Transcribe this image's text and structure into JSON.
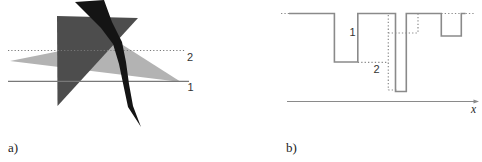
{
  "colors": {
    "light_gray_shape": "#b3b3b3",
    "dark_gray_shape": "#4d4d4d",
    "black_shape": "#141414",
    "cut_line": "#787878",
    "step_line": "#8a8a8a",
    "axis_line": "#8a8a8a",
    "label_text": "#333333"
  },
  "panel_a": {
    "label": "a)",
    "shapes": {
      "light_triangle": {
        "fill": "#b3b3b3",
        "points": [
          [
            10,
            61
          ],
          [
            115,
            40
          ],
          [
            181,
            82
          ]
        ]
      },
      "dark_triangle": {
        "fill": "#4d4d4d",
        "points": [
          [
            57,
            16
          ],
          [
            138,
            18
          ],
          [
            57.5,
            106
          ]
        ]
      },
      "black_ribbon": {
        "fill": "#141414",
        "points": [
          [
            75,
            2
          ],
          [
            104,
            0
          ],
          [
            112,
            22
          ],
          [
            122,
            42
          ],
          [
            126,
            62
          ],
          [
            129,
            84
          ],
          [
            133,
            106
          ],
          [
            141,
            127
          ],
          [
            128,
            107
          ],
          [
            124,
            88
          ],
          [
            119,
            64
          ],
          [
            113,
            44
          ],
          [
            101,
            28
          ]
        ]
      }
    },
    "cut_lines": [
      {
        "name": "cut-line-2",
        "style": "dotted",
        "y": 50.5,
        "x1": 8,
        "x2": 185,
        "label": "2",
        "label_x": 187,
        "label_y": 61
      },
      {
        "name": "cut-line-1",
        "style": "solid",
        "y": 81.3,
        "x1": 8,
        "x2": 189,
        "label": "1",
        "label_x": 187.5,
        "label_y": 91
      }
    ]
  },
  "panel_b": {
    "label": "b)",
    "solid_step_path": [
      [
        289,
        13.5
      ],
      [
        334.4,
        13.5
      ],
      [
        334.4,
        62
      ],
      [
        357.8,
        62
      ],
      [
        357.8,
        13.5
      ],
      [
        395.5,
        13.5
      ],
      [
        395.5,
        91.5
      ],
      [
        406.3,
        91.5
      ],
      [
        406.3,
        13.5
      ],
      [
        441.3,
        13.5
      ],
      [
        441.3,
        36
      ],
      [
        461.3,
        36
      ],
      [
        461.3,
        13.5
      ],
      [
        465.5,
        13.5
      ]
    ],
    "dotted_segments": [
      {
        "name": "dotted-leadin",
        "x1": 281,
        "y1": 13.5,
        "x2": 289,
        "y2": 13.5
      },
      {
        "name": "dotted-level-mid",
        "x1": 357.8,
        "y1": 62.3,
        "x2": 388.3,
        "y2": 62.3
      },
      {
        "name": "dotted-tall-vertical",
        "x1": 388.3,
        "y1": 15,
        "x2": 388.3,
        "y2": 90
      },
      {
        "name": "dotted-level-upper",
        "x1": 388.3,
        "y1": 33,
        "x2": 418,
        "y2": 33
      },
      {
        "name": "dotted-step-up",
        "x1": 418,
        "y1": 13.5,
        "x2": 418,
        "y2": 33
      },
      {
        "name": "dotted-deep-bottom",
        "x1": 388.3,
        "y1": 90,
        "x2": 398,
        "y2": 90
      },
      {
        "name": "dotted-top-over-notch",
        "x1": 441.3,
        "y1": 13.5,
        "x2": 461.3,
        "y2": 13.5
      },
      {
        "name": "dotted-tail",
        "x1": 465.5,
        "y1": 13.5,
        "x2": 474.5,
        "y2": 13.5
      }
    ],
    "labels": [
      {
        "text": "1",
        "x": 349.5,
        "y": 36
      },
      {
        "text": "2",
        "x": 373.5,
        "y": 73
      }
    ],
    "axis": {
      "y": 101.5,
      "x1": 287,
      "x2": 475,
      "arrow_tip_x": 479,
      "label": "x",
      "label_x": 471,
      "label_y": 113
    }
  }
}
